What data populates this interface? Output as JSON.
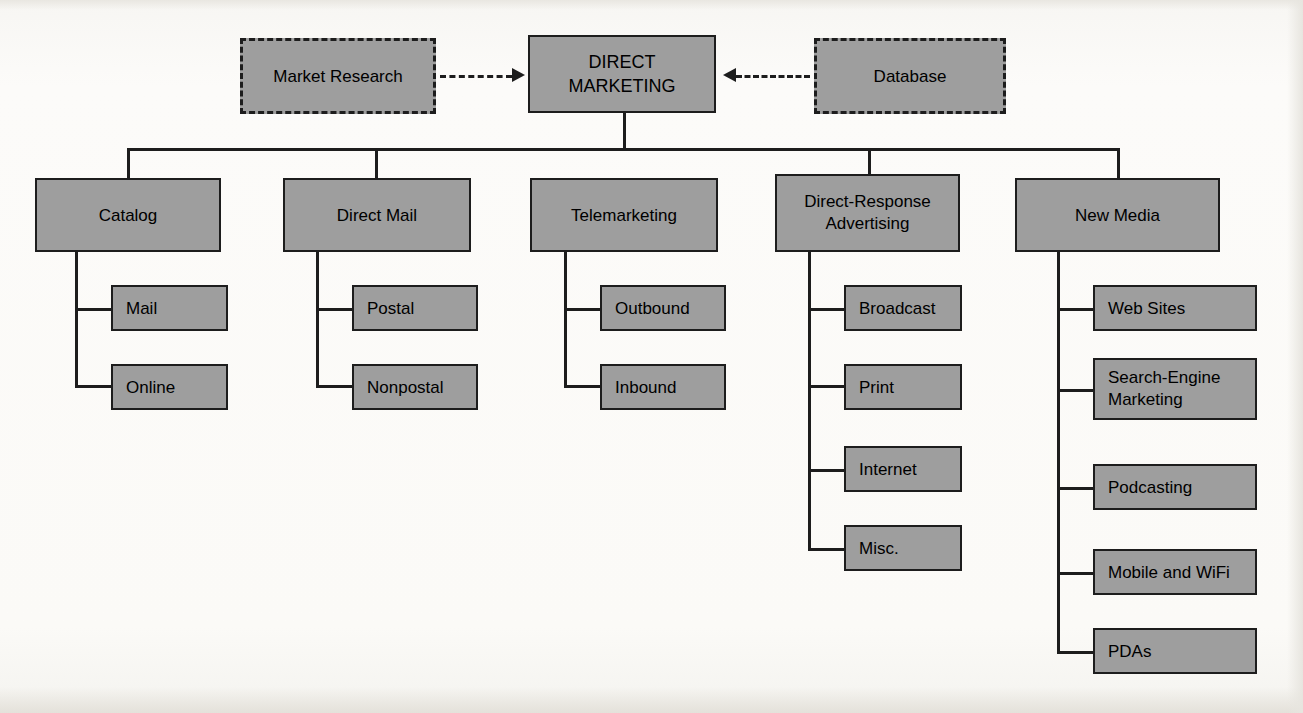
{
  "diagram": {
    "type": "hierarchy-org-chart",
    "root": {
      "label": "DIRECT\nMARKETING"
    },
    "inputs": [
      {
        "label": "Market Research",
        "style": "dashed",
        "arrow": "right"
      },
      {
        "label": "Database",
        "style": "dashed",
        "arrow": "left"
      }
    ],
    "branches": [
      {
        "label": "Catalog",
        "children": [
          {
            "label": "Mail"
          },
          {
            "label": "Online"
          }
        ]
      },
      {
        "label": "Direct Mail",
        "children": [
          {
            "label": "Postal"
          },
          {
            "label": "Nonpostal"
          }
        ]
      },
      {
        "label": "Telemarketing",
        "children": [
          {
            "label": "Outbound"
          },
          {
            "label": "Inbound"
          }
        ]
      },
      {
        "label": "Direct-Response\nAdvertising",
        "children": [
          {
            "label": "Broadcast"
          },
          {
            "label": "Print"
          },
          {
            "label": "Internet"
          },
          {
            "label": "Misc."
          }
        ]
      },
      {
        "label": "New Media",
        "children": [
          {
            "label": "Web Sites"
          },
          {
            "label": "Search-Engine\nMarketing"
          },
          {
            "label": "Podcasting"
          },
          {
            "label": "Mobile and WiFi"
          },
          {
            "label": "PDAs"
          }
        ]
      }
    ],
    "colors": {
      "node_fill": "#9e9e9e",
      "node_border": "#1d1d1d",
      "text": "#000000",
      "background": "#fbfaf8"
    }
  }
}
